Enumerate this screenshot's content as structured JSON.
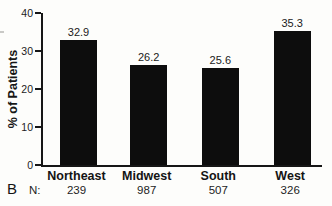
{
  "figure": {
    "panel_label": "B",
    "n_row_label": "N:"
  },
  "chart_data": {
    "type": "bar",
    "title": "",
    "xlabel": "",
    "ylabel": "% of Patients",
    "categories": [
      "Northeast",
      "Midwest",
      "South",
      "West"
    ],
    "values": [
      32.9,
      26.2,
      25.6,
      35.3
    ],
    "n_values": [
      239,
      987,
      507,
      326
    ],
    "ylim": [
      0,
      40
    ],
    "yticks": [
      0,
      10,
      20,
      30,
      40
    ],
    "bar_color": "#0d0d0d",
    "grid": false,
    "legend": "none"
  }
}
